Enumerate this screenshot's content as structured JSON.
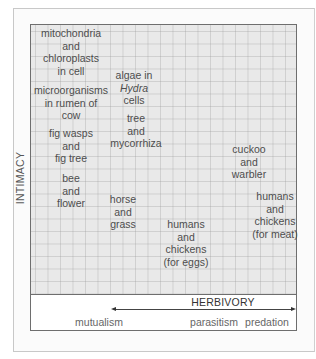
{
  "diagram": {
    "y_axis_label": "INTIMACY",
    "x_axis": {
      "arrow_label": "HERBIVORY",
      "categories": [
        "mutualism",
        "parasitism",
        "predation"
      ]
    },
    "relationships": [
      {
        "lines": [
          "mitochondria",
          "and",
          "chloroplasts",
          "in cell"
        ]
      },
      {
        "lines": [
          "algae in",
          "Hydra",
          "cells"
        ],
        "italic_line": 1
      },
      {
        "lines": [
          "microorganisms",
          "in rumen of",
          "cow"
        ]
      },
      {
        "lines": [
          "tree",
          "and",
          "mycorrhiza"
        ]
      },
      {
        "lines": [
          "fig wasps",
          "and",
          "fig tree"
        ]
      },
      {
        "lines": [
          "cuckoo",
          "and",
          "warbler"
        ]
      },
      {
        "lines": [
          "bee",
          "and",
          "flower"
        ]
      },
      {
        "lines": [
          "horse",
          "and",
          "grass"
        ]
      },
      {
        "lines": [
          "humans",
          "and",
          "chickens",
          "(for meat)"
        ]
      },
      {
        "lines": [
          "humans",
          "and",
          "chickens",
          "(for eggs)"
        ]
      }
    ]
  }
}
